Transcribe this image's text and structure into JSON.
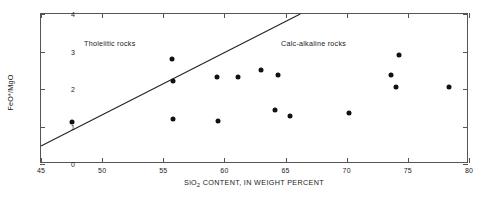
{
  "chart_data": {
    "type": "scatter",
    "title": "",
    "xlabel": "SiO2 CONTENT, IN WEIGHT PERCENT",
    "xlabel_main": "SiO",
    "xlabel_sub": "2",
    "xlabel_rest": " CONTENT, IN WEIGHT PERCENT",
    "ylabel": "FeO*/MgO",
    "xlim": [
      45,
      80
    ],
    "ylim": [
      0,
      4
    ],
    "xticks": [
      45,
      50,
      55,
      60,
      65,
      70,
      75,
      80
    ],
    "yticks": [
      0,
      1,
      2,
      3,
      4
    ],
    "xtick_labels": [
      "45",
      "50",
      "55",
      "60",
      "65",
      "70",
      "75",
      "80"
    ],
    "ytick_labels": [
      "0",
      "1",
      "2",
      "3",
      "4"
    ],
    "grid": false,
    "legend": "none",
    "marker": "filled-circle",
    "marker_color": "#111111",
    "points": [
      {
        "x": 47.5,
        "y": 1.12
      },
      {
        "x": 55.7,
        "y": 2.8
      },
      {
        "x": 55.8,
        "y": 2.22
      },
      {
        "x": 55.8,
        "y": 1.2
      },
      {
        "x": 59.4,
        "y": 2.33
      },
      {
        "x": 59.5,
        "y": 1.15
      },
      {
        "x": 61.1,
        "y": 2.33
      },
      {
        "x": 63.0,
        "y": 2.52
      },
      {
        "x": 64.1,
        "y": 1.45
      },
      {
        "x": 64.4,
        "y": 2.37
      },
      {
        "x": 65.4,
        "y": 1.27
      },
      {
        "x": 70.2,
        "y": 1.35
      },
      {
        "x": 73.6,
        "y": 2.37
      },
      {
        "x": 74.0,
        "y": 2.05
      },
      {
        "x": 74.3,
        "y": 2.92
      },
      {
        "x": 78.4,
        "y": 2.05
      }
    ],
    "divider": {
      "name": "tholeiitic-calc-alkaline-divider",
      "x0": 45,
      "y0": 0.43,
      "x1": 66.3,
      "y1": 4.0,
      "color": "#222222"
    },
    "annotations": [
      {
        "name": "tholeiitic-label",
        "text": "Tholeiitic rocks",
        "x": 45.6,
        "y": 3.3
      },
      {
        "name": "calc-alkaline-label",
        "text": "Calc-alkaline rocks",
        "x": 61.4,
        "y": 3.3
      }
    ]
  }
}
